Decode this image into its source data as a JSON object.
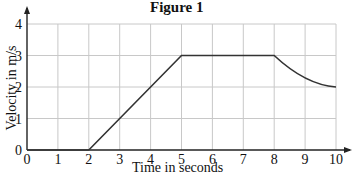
{
  "chart_data": {
    "type": "line",
    "title": "Figure 1",
    "xlabel": "Time in seconds",
    "ylabel": "Velocity in m/s",
    "xlim": [
      0,
      10
    ],
    "ylim": [
      0,
      4
    ],
    "x_ticks": [
      "0",
      "1",
      "2",
      "3",
      "4",
      "5",
      "6",
      "7",
      "8",
      "9",
      "10"
    ],
    "y_ticks": [
      "0",
      "1",
      "2",
      "3",
      "4"
    ],
    "grid": true,
    "legend": null,
    "series": [
      {
        "name": "velocity",
        "points": [
          [
            0,
            0
          ],
          [
            2,
            0
          ],
          [
            5,
            3
          ],
          [
            8,
            3
          ],
          [
            8.5,
            2.6
          ],
          [
            9,
            2.35
          ],
          [
            9.5,
            2.12
          ],
          [
            10,
            2
          ]
        ],
        "description": "rest 0-2 s, uniform acceleration to 3 m/s at 5 s, constant 3 m/s until 8 s, curved deceleration to 2 m/s at 10 s"
      }
    ],
    "color": "#333333"
  }
}
